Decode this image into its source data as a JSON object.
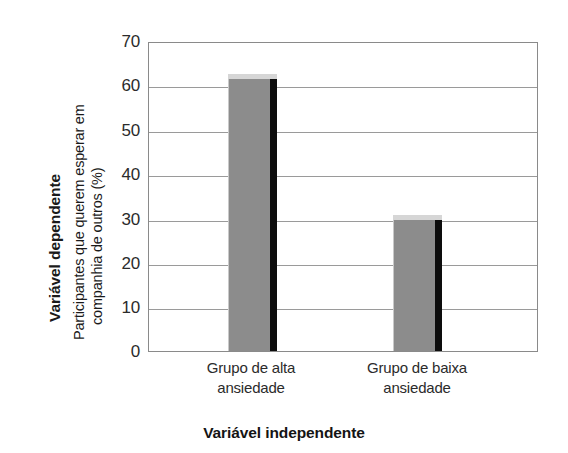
{
  "chart_data": {
    "type": "bar",
    "title": "",
    "subtitle": "",
    "categories": [
      "Grupo de alta ansiedade",
      "Grupo de baixa ansiedade"
    ],
    "category_lines": [
      [
        "Grupo de alta",
        "ansiedade"
      ],
      [
        "Grupo de baixa",
        "ansiedade"
      ]
    ],
    "values": [
      63,
      31
    ],
    "xlabel": "Variável independente",
    "ylabel": "Participantes que querem esperar em companhia de outros (%)",
    "ylabel_lines": [
      "Participantes que querem esperar em",
      "companhia de outros (%)"
    ],
    "ylabel_bold": "Variável dependente",
    "ylim": [
      0,
      70
    ],
    "yticks": [
      70,
      60,
      50,
      40,
      30,
      20,
      10,
      0
    ],
    "ytick_labels": [
      "70",
      "60",
      "50",
      "40",
      "30",
      "20",
      "10",
      "0"
    ],
    "grid": true,
    "grid_axis": "y",
    "legend": null,
    "legend_position": "none",
    "bar_face_color": "#8c8c8c",
    "bar_side_color": "#0d0d0d",
    "bar_cap_color": "#d6d6d6",
    "grid_color": "#9a9a9a",
    "axis_color": "#8a8a8a",
    "background_color": "#ffffff",
    "text_color": "#2b2b2b"
  }
}
